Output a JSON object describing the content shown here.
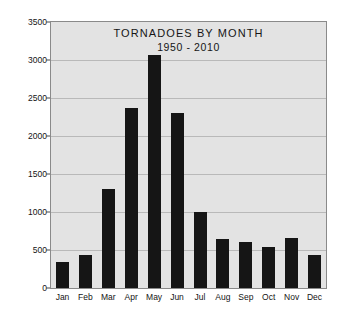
{
  "chart_data": {
    "type": "bar",
    "title": "TORNADOES BY MONTH",
    "subtitle": "1950 - 2010",
    "xlabel": "",
    "ylabel": "Number of Tornadoes",
    "categories": [
      "Jan",
      "Feb",
      "Mar",
      "Apr",
      "May",
      "Jun",
      "Jul",
      "Aug",
      "Sep",
      "Oct",
      "Nov",
      "Dec"
    ],
    "values": [
      340,
      430,
      1300,
      2370,
      3060,
      2300,
      1000,
      650,
      600,
      540,
      660,
      430
    ],
    "ylim": [
      0,
      3500
    ],
    "yticks": [
      0,
      500,
      1000,
      1500,
      2000,
      2500,
      3000,
      3500
    ],
    "ytick_labels": [
      "0",
      "500",
      "1000",
      "1500",
      "2000",
      "2500",
      "3000",
      "3500"
    ],
    "grid": true,
    "legend": null,
    "bar_color": "#151515",
    "plot_background": "#e3e3e3",
    "figure_background": "#ffffff",
    "gridline_color": "#b9b9b9",
    "frame_color": "#8a8a8a"
  }
}
